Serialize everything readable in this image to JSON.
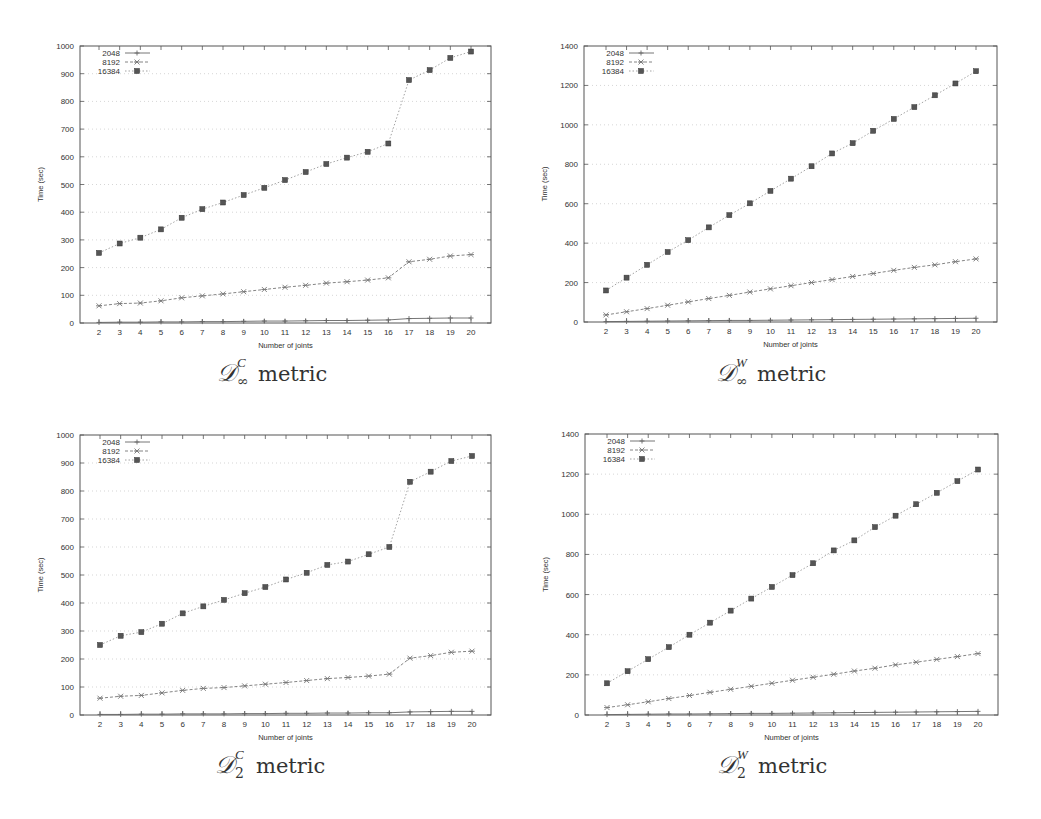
{
  "figure": {
    "panels": [
      {
        "id": "tl",
        "caption_base": "D",
        "caption_sup": "C",
        "caption_sub": "∞",
        "caption_word": "metric"
      },
      {
        "id": "tr",
        "caption_base": "D",
        "caption_sup": "W",
        "caption_sub": "∞",
        "caption_word": "metric"
      },
      {
        "id": "bl",
        "caption_base": "D",
        "caption_sup": "C",
        "caption_sub": "2",
        "caption_word": "metric"
      },
      {
        "id": "br",
        "caption_base": "D",
        "caption_sup": "W",
        "caption_sub": "2",
        "caption_word": "metric"
      }
    ]
  },
  "chart_data": [
    {
      "type": "line",
      "title": "D_∞^C metric",
      "xlabel": "Number of joints",
      "ylabel": "Time (sec)",
      "x": [
        2,
        3,
        4,
        5,
        6,
        7,
        8,
        9,
        10,
        11,
        12,
        13,
        14,
        15,
        16,
        17,
        18,
        19,
        20
      ],
      "ylim": [
        0,
        1000
      ],
      "yticks": [
        0,
        100,
        200,
        300,
        400,
        500,
        600,
        700,
        800,
        900,
        1000
      ],
      "grid": true,
      "legend_position": "upper-left",
      "series": [
        {
          "name": "2048",
          "marker": "plus",
          "dash": "solid",
          "values": [
            2,
            3,
            3,
            4,
            4,
            5,
            5,
            6,
            7,
            7,
            8,
            9,
            9,
            10,
            11,
            16,
            17,
            18,
            18
          ]
        },
        {
          "name": "8192",
          "marker": "x",
          "dash": "dashed",
          "values": [
            62,
            70,
            72,
            80,
            91,
            98,
            105,
            113,
            121,
            129,
            136,
            144,
            149,
            155,
            163,
            221,
            230,
            242,
            247
          ]
        },
        {
          "name": "16384",
          "marker": "square",
          "dash": "dotted",
          "values": [
            253,
            287,
            308,
            338,
            380,
            411,
            435,
            462,
            488,
            516,
            545,
            574,
            597,
            618,
            648,
            877,
            913,
            957,
            980
          ]
        }
      ]
    },
    {
      "type": "line",
      "title": "D_∞^W metric",
      "xlabel": "Number of joints",
      "ylabel": "Time (sec)",
      "x": [
        2,
        3,
        4,
        5,
        6,
        7,
        8,
        9,
        10,
        11,
        12,
        13,
        14,
        15,
        16,
        17,
        18,
        19,
        20
      ],
      "ylim": [
        0,
        1400
      ],
      "yticks": [
        0,
        200,
        400,
        600,
        800,
        1000,
        1200,
        1400
      ],
      "grid": true,
      "legend_position": "upper-left",
      "series": [
        {
          "name": "2048",
          "marker": "plus",
          "dash": "solid",
          "values": [
            2,
            3,
            4,
            5,
            6,
            7,
            8,
            8,
            9,
            10,
            11,
            12,
            13,
            14,
            15,
            16,
            17,
            18,
            19
          ]
        },
        {
          "name": "8192",
          "marker": "x",
          "dash": "dashed",
          "values": [
            36,
            52,
            68,
            85,
            102,
            119,
            135,
            152,
            168,
            184,
            200,
            215,
            231,
            246,
            262,
            277,
            290,
            306,
            320
          ]
        },
        {
          "name": "16384",
          "marker": "square",
          "dash": "dotted",
          "values": [
            160,
            225,
            290,
            355,
            415,
            480,
            542,
            602,
            665,
            727,
            790,
            855,
            907,
            970,
            1030,
            1090,
            1150,
            1210,
            1272
          ]
        }
      ]
    },
    {
      "type": "line",
      "title": "D_2^C metric",
      "xlabel": "Number of joints",
      "ylabel": "Time (sec)",
      "x": [
        2,
        3,
        4,
        5,
        6,
        7,
        8,
        9,
        10,
        11,
        12,
        13,
        14,
        15,
        16,
        17,
        18,
        19,
        20
      ],
      "ylim": [
        0,
        1000
      ],
      "yticks": [
        0,
        100,
        200,
        300,
        400,
        500,
        600,
        700,
        800,
        900,
        1000
      ],
      "grid": true,
      "legend_position": "upper-left",
      "series": [
        {
          "name": "2048",
          "marker": "plus",
          "dash": "solid",
          "values": [
            2,
            2,
            3,
            3,
            4,
            4,
            4,
            5,
            5,
            6,
            6,
            7,
            7,
            8,
            8,
            11,
            12,
            13,
            13
          ]
        },
        {
          "name": "8192",
          "marker": "x",
          "dash": "dashed",
          "values": [
            60,
            67,
            70,
            79,
            88,
            95,
            98,
            104,
            110,
            116,
            123,
            130,
            134,
            139,
            146,
            203,
            212,
            224,
            228
          ]
        },
        {
          "name": "16384",
          "marker": "square",
          "dash": "dotted",
          "values": [
            250,
            283,
            296,
            326,
            363,
            388,
            411,
            435,
            457,
            484,
            508,
            536,
            548,
            574,
            600,
            833,
            869,
            907,
            925
          ]
        }
      ]
    },
    {
      "type": "line",
      "title": "D_2^W metric",
      "xlabel": "Number of joints",
      "ylabel": "Time (sec)",
      "x": [
        2,
        3,
        4,
        5,
        6,
        7,
        8,
        9,
        10,
        11,
        12,
        13,
        14,
        15,
        16,
        17,
        18,
        19,
        20
      ],
      "ylim": [
        0,
        1400
      ],
      "yticks": [
        0,
        200,
        400,
        600,
        800,
        1000,
        1200,
        1400
      ],
      "grid": true,
      "legend_position": "upper-left",
      "series": [
        {
          "name": "2048",
          "marker": "plus",
          "dash": "solid",
          "values": [
            2,
            3,
            4,
            5,
            5,
            6,
            7,
            8,
            8,
            9,
            10,
            11,
            12,
            13,
            14,
            15,
            16,
            17,
            18
          ]
        },
        {
          "name": "8192",
          "marker": "x",
          "dash": "dashed",
          "values": [
            37,
            51,
            66,
            82,
            97,
            113,
            128,
            143,
            158,
            173,
            188,
            203,
            219,
            233,
            250,
            263,
            277,
            291,
            306
          ]
        },
        {
          "name": "16384",
          "marker": "square",
          "dash": "dotted",
          "values": [
            158,
            218,
            278,
            338,
            400,
            460,
            520,
            580,
            638,
            697,
            756,
            820,
            870,
            936,
            993,
            1050,
            1107,
            1165,
            1223
          ]
        }
      ]
    }
  ]
}
